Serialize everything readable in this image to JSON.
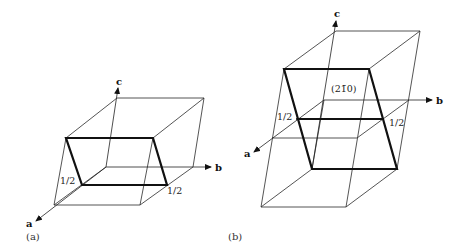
{
  "figures": [
    {
      "id": "a",
      "caption": "(a)",
      "axes": {
        "a": "a",
        "b": "b",
        "c": "c"
      },
      "intercept_labels": [
        "1/2",
        "1/2"
      ],
      "plane_label": ""
    },
    {
      "id": "b",
      "caption": "(b)",
      "axes": {
        "a": "a",
        "b": "b",
        "c": "c"
      },
      "intercept_labels": [
        "1/2",
        "1/2"
      ],
      "plane_label": "(21̄0)"
    }
  ]
}
